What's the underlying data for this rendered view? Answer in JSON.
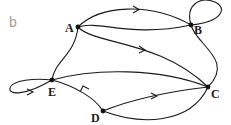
{
  "panel_label": "b",
  "colors": {
    "stroke": "#1a1a1a",
    "panel_label": "#a0a0a0",
    "background": "#ffffff"
  },
  "nodes": [
    {
      "id": "A",
      "label": "A",
      "x": 78,
      "y": 27
    },
    {
      "id": "B",
      "label": "B",
      "x": 191,
      "y": 25
    },
    {
      "id": "C",
      "label": "C",
      "x": 208,
      "y": 87
    },
    {
      "id": "D",
      "label": "D",
      "x": 103,
      "y": 111
    },
    {
      "id": "E",
      "label": "E",
      "x": 52,
      "y": 80
    }
  ],
  "edges": [
    {
      "from": "A",
      "to": "B",
      "directed": true,
      "curve": "upper"
    },
    {
      "from": "A",
      "to": "B",
      "directed": false,
      "curve": "lower"
    },
    {
      "from": "A",
      "to": "C",
      "directed": true
    },
    {
      "from": "A",
      "to": "E",
      "directed": false
    },
    {
      "from": "B",
      "to": "B",
      "directed": false,
      "type": "self-loop"
    },
    {
      "from": "B",
      "to": "C",
      "directed": false
    },
    {
      "from": "E",
      "to": "C",
      "directed": false
    },
    {
      "from": "E",
      "to": "E",
      "directed": true,
      "type": "self-loop"
    },
    {
      "from": "D",
      "to": "E",
      "directed": true
    },
    {
      "from": "D",
      "to": "C",
      "directed": true,
      "curve": "upper"
    },
    {
      "from": "D",
      "to": "C",
      "directed": false,
      "curve": "lower"
    }
  ]
}
